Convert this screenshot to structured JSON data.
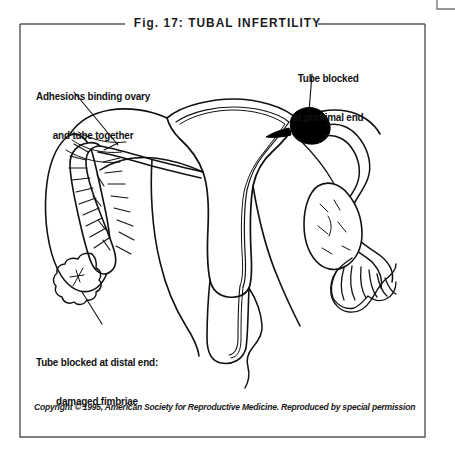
{
  "figure": {
    "title": "Fig. 17: TUBAL INFERTILITY",
    "copyright": "Copyright © 1995, American Society for Reproductive Medicine. Reproduced by special permission"
  },
  "callouts": {
    "adhesions": {
      "line1": "Adhesions binding ovary",
      "line2": "and tube together"
    },
    "proximal": {
      "line1": "Tube blocked",
      "line2": "at proximal end"
    },
    "distal": {
      "line1": "Tube blocked at distal end:",
      "line2": "damaged fimbriae"
    }
  },
  "colors": {
    "ink": "#111111",
    "frame": "#555555",
    "blockage": "#000000",
    "background": "#ffffff"
  },
  "anatomy": {
    "labels": [
      "uterus",
      "left-fallopian-tube",
      "right-fallopian-tube",
      "left-ovary",
      "right-ovary",
      "proximal-blockage",
      "left-fimbriae-damaged",
      "right-fimbriae-normal",
      "cervix",
      "vagina"
    ]
  }
}
